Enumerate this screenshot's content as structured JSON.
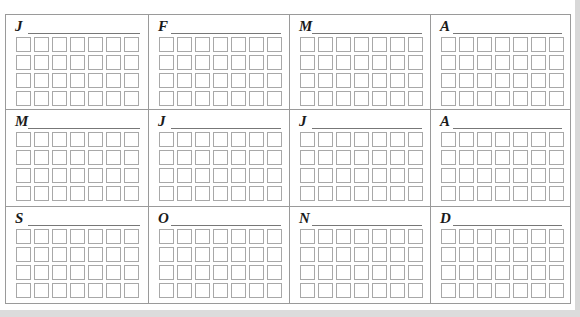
{
  "calendar": {
    "months": [
      {
        "letter": "J"
      },
      {
        "letter": "F"
      },
      {
        "letter": "M"
      },
      {
        "letter": "A"
      },
      {
        "letter": "M"
      },
      {
        "letter": "J"
      },
      {
        "letter": "J"
      },
      {
        "letter": "A"
      },
      {
        "letter": "S"
      },
      {
        "letter": "O"
      },
      {
        "letter": "N"
      },
      {
        "letter": "D"
      }
    ],
    "rows_per_month": 4,
    "cols_per_month": 7,
    "colors": {
      "border": "#9a9a9a",
      "box_border": "#a8a8a8",
      "letter": "#1a1a1a"
    }
  }
}
